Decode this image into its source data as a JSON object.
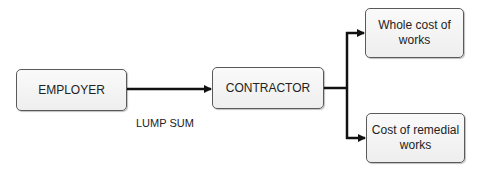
{
  "diagram": {
    "type": "flow",
    "nodes": {
      "employer": {
        "label": "EMPLOYER"
      },
      "contractor": {
        "label": "CONTRACTOR"
      },
      "whole_cost": {
        "label": "Whole cost of works"
      },
      "remedial": {
        "label": "Cost of remedial works"
      }
    },
    "edges": [
      {
        "from": "employer",
        "to": "contractor",
        "label": "LUMP SUM"
      },
      {
        "from": "contractor",
        "to": "whole_cost",
        "label": ""
      },
      {
        "from": "contractor",
        "to": "remedial",
        "label": ""
      }
    ],
    "edge_labels": {
      "lump_sum": "LUMP SUM"
    },
    "colors": {
      "box_border": "#5a5a5a",
      "box_fill": "#f4f4f4",
      "line": "#111111",
      "text": "#222222"
    }
  }
}
